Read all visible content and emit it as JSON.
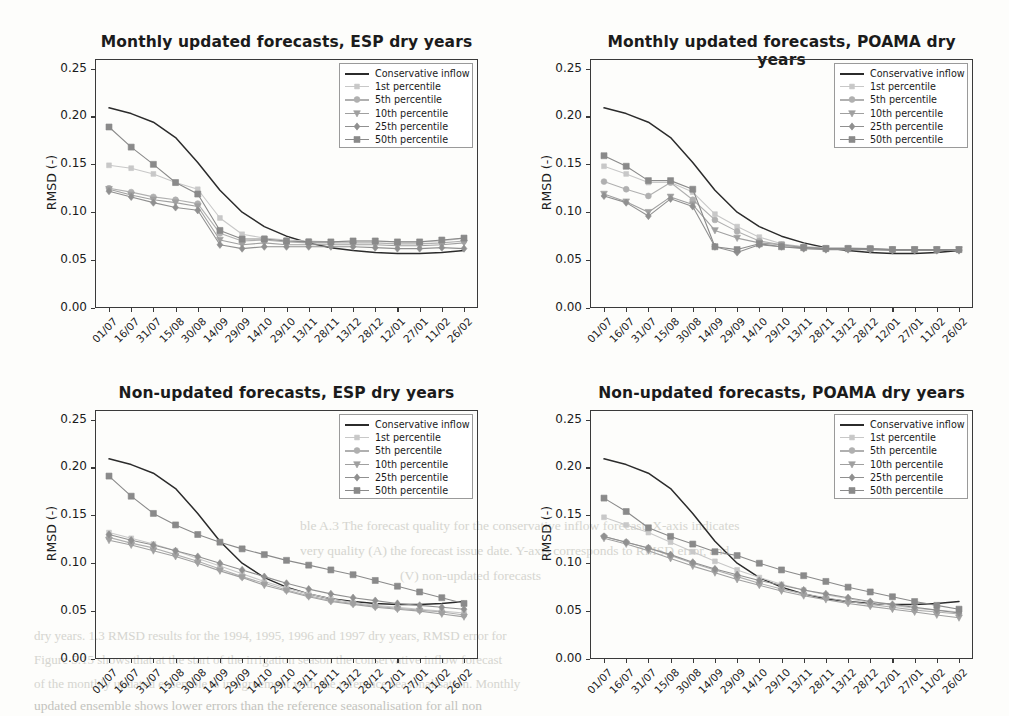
{
  "figure": {
    "ylabel": "RMSD (-)",
    "ytick_labels": [
      "0.00",
      "0.05",
      "0.10",
      "0.15",
      "0.20",
      "0.25"
    ],
    "xtick_labels": [
      "01/07",
      "16/07",
      "31/07",
      "15/08",
      "30/08",
      "14/09",
      "29/09",
      "14/10",
      "29/10",
      "13/11",
      "28/11",
      "13/12",
      "28/12",
      "12/01",
      "27/01",
      "11/02",
      "26/02"
    ],
    "legend_labels": [
      "Conservative inflow",
      "1st percentile",
      "5th percentile",
      "10th percentile",
      "25th percentile",
      "50th percentile"
    ],
    "legend_markers": [
      "line",
      "square",
      "circle",
      "triangle-down",
      "diamond",
      "square"
    ],
    "series_colors": [
      "#2b2b2b",
      "#c8c8c8",
      "#b0b0b0",
      "#a0a0a0",
      "#909090",
      "#8a8a8a"
    ]
  },
  "bleed_text": {
    "l1": "dry years. 1.3 RMSD results for the 1994, 1995, 1996 and 1997 dry years, RMSD error for",
    "l2": "ble A.3 The forecast quality for the conservative inflow forecast. X-axis indicates",
    "l3": "very quality (A) the forecast issue date. Y-axis corresponds to RMSD error, and",
    "l4": "(V) non-updated forecasts",
    "l5": "Figure 5.15 shows that at the start of the irrigation season the conservative inflow forecast",
    "l6": "of the monthly updated ensemble is in agreement with the reference seasonalisation. Monthly",
    "l7": "updated ensemble shows lower errors than the reference seasonalisation for all non"
  },
  "chart_data": [
    {
      "type": "line",
      "title": "Monthly updated forecasts, ESP dry years",
      "xlabel": "",
      "ylabel": "RMSD (-)",
      "ylim": [
        0.0,
        0.26
      ],
      "grid": false,
      "legend_position": "upper right",
      "categories": [
        "01/07",
        "16/07",
        "31/07",
        "15/08",
        "30/08",
        "14/09",
        "29/09",
        "14/10",
        "29/10",
        "13/11",
        "28/11",
        "13/12",
        "28/12",
        "12/01",
        "27/01",
        "11/02",
        "26/02"
      ],
      "series": [
        {
          "name": "Conservative inflow",
          "marker": "line",
          "values": [
            0.209,
            0.203,
            0.194,
            0.178,
            0.152,
            0.123,
            0.1,
            0.085,
            0.075,
            0.068,
            0.063,
            0.06,
            0.058,
            0.057,
            0.057,
            0.058,
            0.06
          ]
        },
        {
          "name": "1st percentile",
          "marker": "square",
          "values": [
            0.149,
            0.146,
            0.14,
            0.131,
            0.124,
            0.094,
            0.077,
            0.073,
            0.071,
            0.07,
            0.069,
            0.07,
            0.07,
            0.069,
            0.069,
            0.07,
            0.073
          ]
        },
        {
          "name": "5th percentile",
          "marker": "circle",
          "values": [
            0.125,
            0.121,
            0.116,
            0.113,
            0.109,
            0.078,
            0.07,
            0.071,
            0.069,
            0.068,
            0.068,
            0.068,
            0.068,
            0.067,
            0.067,
            0.068,
            0.07
          ]
        },
        {
          "name": "10th percentile",
          "marker": "triangle-down",
          "values": [
            0.124,
            0.118,
            0.113,
            0.11,
            0.106,
            0.071,
            0.066,
            0.068,
            0.066,
            0.066,
            0.066,
            0.066,
            0.066,
            0.065,
            0.065,
            0.066,
            0.068
          ]
        },
        {
          "name": "25th percentile",
          "marker": "diamond",
          "values": [
            0.122,
            0.116,
            0.11,
            0.105,
            0.102,
            0.066,
            0.062,
            0.064,
            0.064,
            0.064,
            0.064,
            0.064,
            0.063,
            0.062,
            0.062,
            0.063,
            0.062
          ]
        },
        {
          "name": "50th percentile",
          "marker": "square",
          "values": [
            0.189,
            0.168,
            0.15,
            0.131,
            0.119,
            0.081,
            0.072,
            0.072,
            0.07,
            0.069,
            0.069,
            0.07,
            0.07,
            0.069,
            0.069,
            0.071,
            0.073
          ]
        }
      ]
    },
    {
      "type": "line",
      "title": "Monthly updated forecasts, POAMA dry years",
      "xlabel": "",
      "ylabel": "RMSD (-)",
      "ylim": [
        0.0,
        0.26
      ],
      "grid": false,
      "legend_position": "upper right",
      "categories": [
        "01/07",
        "16/07",
        "31/07",
        "15/08",
        "30/08",
        "14/09",
        "29/09",
        "14/10",
        "29/10",
        "13/11",
        "28/11",
        "13/12",
        "28/12",
        "12/01",
        "27/01",
        "11/02",
        "26/02"
      ],
      "series": [
        {
          "name": "Conservative inflow",
          "marker": "line",
          "values": [
            0.209,
            0.203,
            0.194,
            0.178,
            0.152,
            0.123,
            0.1,
            0.085,
            0.075,
            0.068,
            0.063,
            0.06,
            0.058,
            0.057,
            0.057,
            0.058,
            0.06
          ]
        },
        {
          "name": "1st percentile",
          "marker": "square",
          "values": [
            0.148,
            0.14,
            0.131,
            0.131,
            0.121,
            0.098,
            0.085,
            0.074,
            0.067,
            0.064,
            0.063,
            0.063,
            0.062,
            0.061,
            0.061,
            0.061,
            0.061
          ]
        },
        {
          "name": "5th percentile",
          "marker": "circle",
          "values": [
            0.132,
            0.124,
            0.117,
            0.131,
            0.113,
            0.092,
            0.08,
            0.07,
            0.066,
            0.064,
            0.062,
            0.062,
            0.062,
            0.061,
            0.061,
            0.061,
            0.061
          ]
        },
        {
          "name": "10th percentile",
          "marker": "triangle-down",
          "values": [
            0.119,
            0.111,
            0.1,
            0.116,
            0.108,
            0.081,
            0.073,
            0.068,
            0.066,
            0.063,
            0.062,
            0.062,
            0.061,
            0.061,
            0.061,
            0.061,
            0.061
          ]
        },
        {
          "name": "25th percentile",
          "marker": "diamond",
          "values": [
            0.117,
            0.11,
            0.096,
            0.114,
            0.106,
            0.064,
            0.058,
            0.066,
            0.064,
            0.062,
            0.061,
            0.061,
            0.061,
            0.06,
            0.06,
            0.06,
            0.06
          ]
        },
        {
          "name": "50th percentile",
          "marker": "square",
          "values": [
            0.159,
            0.148,
            0.133,
            0.133,
            0.124,
            0.064,
            0.061,
            0.067,
            0.064,
            0.063,
            0.062,
            0.062,
            0.062,
            0.061,
            0.061,
            0.061,
            0.061
          ]
        }
      ]
    },
    {
      "type": "line",
      "title": "Non-updated forecasts, ESP dry years",
      "xlabel": "",
      "ylabel": "RMSD (-)",
      "ylim": [
        0.0,
        0.26
      ],
      "grid": false,
      "legend_position": "upper right",
      "categories": [
        "01/07",
        "16/07",
        "31/07",
        "15/08",
        "30/08",
        "14/09",
        "29/09",
        "14/10",
        "29/10",
        "13/11",
        "28/11",
        "13/12",
        "28/12",
        "12/01",
        "27/01",
        "11/02",
        "26/02"
      ],
      "series": [
        {
          "name": "Conservative inflow",
          "marker": "line",
          "values": [
            0.209,
            0.203,
            0.194,
            0.178,
            0.152,
            0.123,
            0.1,
            0.085,
            0.075,
            0.068,
            0.063,
            0.06,
            0.058,
            0.057,
            0.057,
            0.058,
            0.06
          ]
        },
        {
          "name": "1st percentile",
          "marker": "square",
          "values": [
            0.132,
            0.126,
            0.12,
            0.113,
            0.105,
            0.097,
            0.089,
            0.081,
            0.074,
            0.068,
            0.063,
            0.059,
            0.056,
            0.054,
            0.052,
            0.05,
            0.048
          ]
        },
        {
          "name": "5th percentile",
          "marker": "circle",
          "values": [
            0.127,
            0.121,
            0.116,
            0.109,
            0.102,
            0.094,
            0.086,
            0.079,
            0.072,
            0.066,
            0.061,
            0.058,
            0.055,
            0.053,
            0.051,
            0.049,
            0.046
          ]
        },
        {
          "name": "10th percentile",
          "marker": "triangle-down",
          "values": [
            0.124,
            0.119,
            0.113,
            0.107,
            0.1,
            0.092,
            0.085,
            0.077,
            0.071,
            0.065,
            0.06,
            0.057,
            0.054,
            0.052,
            0.05,
            0.047,
            0.044
          ]
        },
        {
          "name": "25th percentile",
          "marker": "diamond",
          "values": [
            0.13,
            0.124,
            0.119,
            0.113,
            0.107,
            0.1,
            0.093,
            0.086,
            0.079,
            0.073,
            0.068,
            0.064,
            0.061,
            0.058,
            0.056,
            0.054,
            0.052
          ]
        },
        {
          "name": "50th percentile",
          "marker": "square",
          "values": [
            0.191,
            0.17,
            0.152,
            0.14,
            0.13,
            0.122,
            0.115,
            0.109,
            0.103,
            0.098,
            0.093,
            0.088,
            0.082,
            0.076,
            0.07,
            0.064,
            0.058
          ]
        }
      ]
    },
    {
      "type": "line",
      "title": "Non-updated forecasts, POAMA dry years",
      "xlabel": "",
      "ylabel": "RMSD (-)",
      "ylim": [
        0.0,
        0.26
      ],
      "grid": false,
      "legend_position": "upper right",
      "categories": [
        "01/07",
        "16/07",
        "31/07",
        "15/08",
        "30/08",
        "14/09",
        "29/09",
        "14/10",
        "29/10",
        "13/11",
        "28/11",
        "13/12",
        "28/12",
        "12/01",
        "27/01",
        "11/02",
        "26/02"
      ],
      "series": [
        {
          "name": "Conservative inflow",
          "marker": "line",
          "values": [
            0.209,
            0.203,
            0.194,
            0.178,
            0.152,
            0.123,
            0.1,
            0.085,
            0.075,
            0.068,
            0.063,
            0.06,
            0.058,
            0.057,
            0.057,
            0.058,
            0.06
          ]
        },
        {
          "name": "1st percentile",
          "marker": "square",
          "values": [
            0.148,
            0.14,
            0.132,
            0.122,
            0.112,
            0.102,
            0.093,
            0.085,
            0.078,
            0.072,
            0.067,
            0.063,
            0.059,
            0.056,
            0.053,
            0.051,
            0.049
          ]
        },
        {
          "name": "5th percentile",
          "marker": "circle",
          "values": [
            0.128,
            0.122,
            0.116,
            0.108,
            0.1,
            0.093,
            0.086,
            0.079,
            0.073,
            0.068,
            0.064,
            0.06,
            0.057,
            0.054,
            0.051,
            0.049,
            0.047
          ]
        },
        {
          "name": "10th percentile",
          "marker": "triangle-down",
          "values": [
            0.126,
            0.12,
            0.113,
            0.105,
            0.097,
            0.09,
            0.083,
            0.077,
            0.071,
            0.066,
            0.062,
            0.058,
            0.055,
            0.052,
            0.049,
            0.046,
            0.043
          ]
        },
        {
          "name": "25th percentile",
          "marker": "diamond",
          "values": [
            0.128,
            0.122,
            0.116,
            0.109,
            0.101,
            0.094,
            0.088,
            0.082,
            0.077,
            0.072,
            0.068,
            0.064,
            0.06,
            0.057,
            0.054,
            0.051,
            0.048
          ]
        },
        {
          "name": "50th percentile",
          "marker": "square",
          "values": [
            0.168,
            0.154,
            0.137,
            0.128,
            0.12,
            0.112,
            0.108,
            0.1,
            0.093,
            0.087,
            0.081,
            0.075,
            0.07,
            0.065,
            0.06,
            0.056,
            0.052
          ]
        }
      ]
    }
  ]
}
